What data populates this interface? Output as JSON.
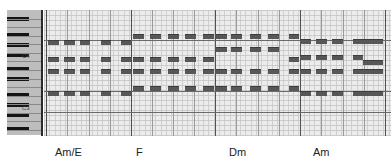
{
  "chords": [
    {
      "label": "Am/E",
      "x": 55
    },
    {
      "label": "F",
      "x": 136
    },
    {
      "label": "Dm",
      "x": 229
    },
    {
      "label": "Am",
      "x": 313
    }
  ],
  "piano": {
    "octave_labels": [
      {
        "label": "C4",
        "y": 56
      },
      {
        "label": "C3",
        "y": 108
      }
    ]
  },
  "grid": {
    "bar_lines_x": [
      46,
      131,
      215,
      300,
      385
    ],
    "c_lines_y": [
      40,
      91,
      112
    ],
    "note_color": "#575757"
  },
  "notes": [
    {
      "x": 48,
      "y": 40,
      "w": 11
    },
    {
      "x": 64,
      "y": 40,
      "w": 11
    },
    {
      "x": 80,
      "y": 40,
      "w": 10
    },
    {
      "x": 101,
      "y": 40,
      "w": 10
    },
    {
      "x": 121,
      "y": 40,
      "w": 10
    },
    {
      "x": 48,
      "y": 57,
      "w": 11
    },
    {
      "x": 64,
      "y": 57,
      "w": 11
    },
    {
      "x": 80,
      "y": 57,
      "w": 10
    },
    {
      "x": 101,
      "y": 57,
      "w": 10
    },
    {
      "x": 121,
      "y": 57,
      "w": 10
    },
    {
      "x": 48,
      "y": 69,
      "w": 11
    },
    {
      "x": 64,
      "y": 69,
      "w": 11
    },
    {
      "x": 80,
      "y": 69,
      "w": 10
    },
    {
      "x": 101,
      "y": 69,
      "w": 10
    },
    {
      "x": 121,
      "y": 69,
      "w": 10
    },
    {
      "x": 48,
      "y": 91,
      "w": 11
    },
    {
      "x": 64,
      "y": 91,
      "w": 11
    },
    {
      "x": 80,
      "y": 91,
      "w": 10
    },
    {
      "x": 101,
      "y": 91,
      "w": 10
    },
    {
      "x": 121,
      "y": 91,
      "w": 10
    },
    {
      "x": 133,
      "y": 34,
      "w": 11
    },
    {
      "x": 150,
      "y": 34,
      "w": 11
    },
    {
      "x": 168,
      "y": 34,
      "w": 11
    },
    {
      "x": 185,
      "y": 34,
      "w": 11
    },
    {
      "x": 203,
      "y": 34,
      "w": 11
    },
    {
      "x": 133,
      "y": 57,
      "w": 11
    },
    {
      "x": 150,
      "y": 57,
      "w": 11
    },
    {
      "x": 168,
      "y": 57,
      "w": 11
    },
    {
      "x": 185,
      "y": 57,
      "w": 11
    },
    {
      "x": 203,
      "y": 57,
      "w": 11
    },
    {
      "x": 133,
      "y": 69,
      "w": 11
    },
    {
      "x": 150,
      "y": 69,
      "w": 11
    },
    {
      "x": 168,
      "y": 69,
      "w": 11
    },
    {
      "x": 185,
      "y": 69,
      "w": 11
    },
    {
      "x": 203,
      "y": 69,
      "w": 11
    },
    {
      "x": 133,
      "y": 86,
      "w": 11
    },
    {
      "x": 150,
      "y": 86,
      "w": 11
    },
    {
      "x": 168,
      "y": 86,
      "w": 11
    },
    {
      "x": 185,
      "y": 86,
      "w": 11
    },
    {
      "x": 203,
      "y": 86,
      "w": 11
    },
    {
      "x": 216,
      "y": 34,
      "w": 11
    },
    {
      "x": 231,
      "y": 34,
      "w": 11
    },
    {
      "x": 250,
      "y": 34,
      "w": 11
    },
    {
      "x": 268,
      "y": 34,
      "w": 11
    },
    {
      "x": 289,
      "y": 34,
      "w": 10
    },
    {
      "x": 216,
      "y": 47,
      "w": 11
    },
    {
      "x": 231,
      "y": 47,
      "w": 11
    },
    {
      "x": 250,
      "y": 47,
      "w": 11
    },
    {
      "x": 268,
      "y": 47,
      "w": 11
    },
    {
      "x": 289,
      "y": 57,
      "w": 10
    },
    {
      "x": 216,
      "y": 69,
      "w": 11
    },
    {
      "x": 231,
      "y": 69,
      "w": 11
    },
    {
      "x": 250,
      "y": 69,
      "w": 11
    },
    {
      "x": 268,
      "y": 69,
      "w": 11
    },
    {
      "x": 289,
      "y": 69,
      "w": 10
    },
    {
      "x": 216,
      "y": 86,
      "w": 11
    },
    {
      "x": 231,
      "y": 86,
      "w": 11
    },
    {
      "x": 250,
      "y": 86,
      "w": 11
    },
    {
      "x": 268,
      "y": 86,
      "w": 11
    },
    {
      "x": 289,
      "y": 86,
      "w": 10
    },
    {
      "x": 300,
      "y": 39,
      "w": 11
    },
    {
      "x": 316,
      "y": 39,
      "w": 11
    },
    {
      "x": 332,
      "y": 39,
      "w": 11
    },
    {
      "x": 353,
      "y": 39,
      "w": 10
    },
    {
      "x": 363,
      "y": 39,
      "w": 10
    },
    {
      "x": 373,
      "y": 39,
      "w": 10
    },
    {
      "x": 300,
      "y": 55,
      "w": 11
    },
    {
      "x": 316,
      "y": 55,
      "w": 11
    },
    {
      "x": 332,
      "y": 55,
      "w": 11
    },
    {
      "x": 353,
      "y": 55,
      "w": 10
    },
    {
      "x": 363,
      "y": 60,
      "w": 10
    },
    {
      "x": 373,
      "y": 60,
      "w": 10
    },
    {
      "x": 300,
      "y": 69,
      "w": 11
    },
    {
      "x": 316,
      "y": 69,
      "w": 11
    },
    {
      "x": 332,
      "y": 69,
      "w": 11
    },
    {
      "x": 353,
      "y": 69,
      "w": 10
    },
    {
      "x": 363,
      "y": 69,
      "w": 10
    },
    {
      "x": 373,
      "y": 69,
      "w": 10
    },
    {
      "x": 300,
      "y": 91,
      "w": 11
    },
    {
      "x": 316,
      "y": 91,
      "w": 11
    },
    {
      "x": 332,
      "y": 91,
      "w": 11
    },
    {
      "x": 353,
      "y": 91,
      "w": 10
    },
    {
      "x": 363,
      "y": 91,
      "w": 10
    },
    {
      "x": 373,
      "y": 91,
      "w": 10
    }
  ]
}
